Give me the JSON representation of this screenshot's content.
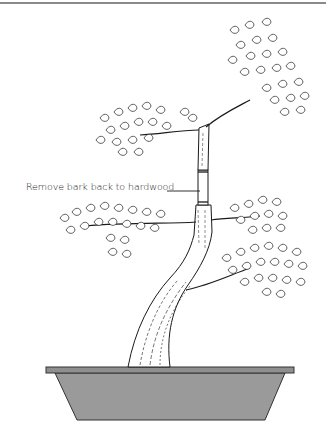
{
  "figure": {
    "callout": {
      "label": "Remove bark back to hardwood"
    },
    "colors": {
      "line": "#1a1a1a",
      "pot_fill": "#9a9a9a",
      "pot_rim": "#8f8f8f",
      "rule": "#8a8a8a",
      "background": "#ffffff"
    }
  }
}
